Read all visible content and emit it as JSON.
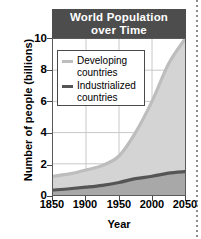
{
  "chart_data": {
    "type": "area",
    "title": "World Population over Time",
    "title_line1": "World  Population",
    "title_line2": "over Time",
    "xlabel": "Year",
    "ylabel": "Number of people (billions)",
    "xlim": [
      1850,
      2050
    ],
    "ylim": [
      0,
      10
    ],
    "xticks": [
      1850,
      1900,
      1950,
      2000,
      2050
    ],
    "xtick_labels": [
      "1850",
      "1900",
      "1950",
      "2000",
      "2050"
    ],
    "yticks": [
      0,
      2,
      4,
      6,
      8,
      10
    ],
    "ytick_labels": [
      "0",
      "2",
      "4",
      "6",
      "8",
      "10"
    ],
    "grid": true,
    "stacked": true,
    "legend_position": "upper-left-inside",
    "x": [
      1850,
      1875,
      1900,
      1925,
      1950,
      1975,
      2000,
      2025,
      2050
    ],
    "series": [
      {
        "name": "Industrialized countries",
        "label_line1": "Industrialized",
        "label_line2": "countries",
        "color": "#555555",
        "values": [
          0.32,
          0.4,
          0.5,
          0.62,
          0.8,
          1.05,
          1.2,
          1.4,
          1.5
        ]
      },
      {
        "name": "Developing countries",
        "label_line1": "Developing",
        "label_line2": "countries",
        "color": "#bdbdbd",
        "values": [
          0.88,
          0.95,
          1.1,
          1.28,
          1.7,
          2.95,
          4.8,
          7.0,
          8.5
        ]
      }
    ],
    "totals": [
      1.2,
      1.35,
      1.6,
      1.9,
      2.5,
      4.0,
      6.0,
      8.4,
      10.0
    ],
    "colors": {
      "banner": "#4d4d4d",
      "banner_text": "#ffffff",
      "developing_fill": "#d4d4d4",
      "developing_line": "#bdbdbd",
      "industrialized_fill": "#a8a8a8",
      "industrialized_line": "#555555",
      "grid": "#c8c8c8",
      "axis": "#5a5a5a",
      "text": "#000000"
    }
  }
}
